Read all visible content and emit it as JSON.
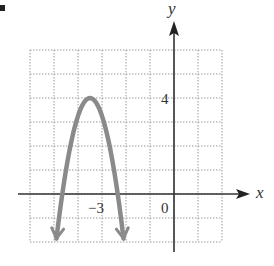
{
  "chart_data": {
    "type": "line",
    "title": "",
    "xlabel": "x",
    "ylabel": "y",
    "xlim": [
      -6,
      2
    ],
    "ylim": [
      -2,
      6
    ],
    "grid": true,
    "tick_labels": {
      "x": [
        {
          "value": -3,
          "label": "−3"
        },
        {
          "value": 0,
          "label": "0"
        }
      ],
      "y": [
        {
          "value": 4,
          "label": "4"
        }
      ]
    },
    "series": [
      {
        "name": "parabola",
        "equation": "y = -3(x + 3.5)^2 + 4",
        "vertex": [
          -3.5,
          4
        ],
        "x_intercepts": [
          -4.65,
          -2.35
        ],
        "opens": "down",
        "arrows_at_ends": true,
        "color": "#8a8a8a"
      }
    ]
  },
  "labels": {
    "x_axis": "x",
    "y_axis": "y",
    "tick_x_neg3": "−3",
    "tick_origin": "0",
    "tick_y_4": "4"
  },
  "colors": {
    "axis": "#333333",
    "grid": "#9a9a9a",
    "curve": "#8a8a8a"
  }
}
